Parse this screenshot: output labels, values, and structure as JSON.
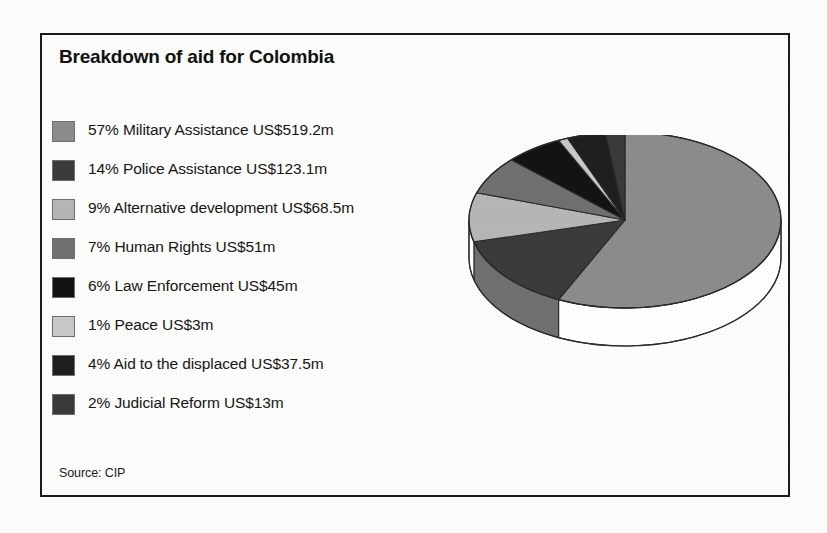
{
  "title": "Breakdown of aid for Colombia",
  "source": "Source: CIP",
  "legend": [
    {
      "swatch": "slice-military-swatch",
      "text": "57% Military Assistance US$519.2m",
      "color": "#8c8c8c"
    },
    {
      "swatch": "slice-police-swatch",
      "text": "14% Police Assistance US$123.1m",
      "color": "#3b3b3b"
    },
    {
      "swatch": "slice-altdev-swatch",
      "text": "9% Alternative development US$68.5m",
      "color": "#b6b6b6"
    },
    {
      "swatch": "slice-humanrights-swatch",
      "text": "7% Human Rights US$51m",
      "color": "#707070"
    },
    {
      "swatch": "slice-lawenf-swatch",
      "text": "6% Law Enforcement US$45m",
      "color": "#131313"
    },
    {
      "swatch": "slice-peace-swatch",
      "text": "1% Peace US$3m",
      "color": "#c9c9c9"
    },
    {
      "swatch": "slice-displaced-swatch",
      "text": "4% Aid to the displaced US$37.5m",
      "color": "#1f1f1f"
    },
    {
      "swatch": "slice-judicial-swatch",
      "text": "2% Judicial Reform US$13m",
      "color": "#3a3a3a"
    }
  ],
  "chart_data": {
    "type": "pie",
    "title": "Breakdown of aid for Colombia",
    "subtitle": "",
    "xlabel": "",
    "ylabel": "",
    "units": "US$ millions",
    "total_percent": 100,
    "total_value": 860.3,
    "source": "Source: CIP",
    "legend_position": "left",
    "three_d": true,
    "grid": false,
    "labels": [
      "Military Assistance",
      "Police Assistance",
      "Alternative development",
      "Human Rights",
      "Law Enforcement",
      "Peace",
      "Aid to the displaced",
      "Judicial Reform"
    ],
    "percentages": [
      57,
      14,
      9,
      7,
      6,
      1,
      4,
      2
    ],
    "values": [
      519.2,
      123.1,
      68.5,
      51,
      45,
      3,
      37.5,
      13
    ],
    "value_labels": [
      "US$519.2m",
      "US$123.1m",
      "US$68.5m",
      "US$51m",
      "US$45m",
      "US$3m",
      "US$37.5m",
      "US$13m"
    ],
    "colors": [
      "#8c8c8c",
      "#3b3b3b",
      "#b6b6b6",
      "#707070",
      "#131313",
      "#c9c9c9",
      "#1f1f1f",
      "#3a3a3a"
    ],
    "slices": [
      {
        "label": "Military Assistance",
        "percent": 57,
        "value": 519.2,
        "value_label": "US$519.2m",
        "color": "#8c8c8c"
      },
      {
        "label": "Police Assistance",
        "percent": 14,
        "value": 123.1,
        "value_label": "US$123.1m",
        "color": "#3b3b3b"
      },
      {
        "label": "Alternative development",
        "percent": 9,
        "value": 68.5,
        "value_label": "US$68.5m",
        "color": "#b6b6b6"
      },
      {
        "label": "Human Rights",
        "percent": 7,
        "value": 51,
        "value_label": "US$51m",
        "color": "#707070"
      },
      {
        "label": "Law Enforcement",
        "percent": 6,
        "value": 45,
        "value_label": "US$45m",
        "color": "#131313"
      },
      {
        "label": "Peace",
        "percent": 1,
        "value": 3,
        "value_label": "US$3m",
        "color": "#c9c9c9"
      },
      {
        "label": "Aid to the displaced",
        "percent": 4,
        "value": 37.5,
        "value_label": "US$37.5m",
        "color": "#1f1f1f"
      },
      {
        "label": "Judicial Reform",
        "percent": 2,
        "value": 13,
        "value_label": "US$13m",
        "color": "#3a3a3a"
      }
    ]
  },
  "pie_geometry": {
    "cx": 175,
    "cy": 85,
    "rx": 156,
    "ry": 88,
    "depth": 38,
    "start_angle_deg": -90,
    "direction": "clockwise",
    "side_colors": [
      "#e2e2e2",
      "#f7f7f7",
      "#ffffff"
    ],
    "outline": "#2a2a2a"
  }
}
